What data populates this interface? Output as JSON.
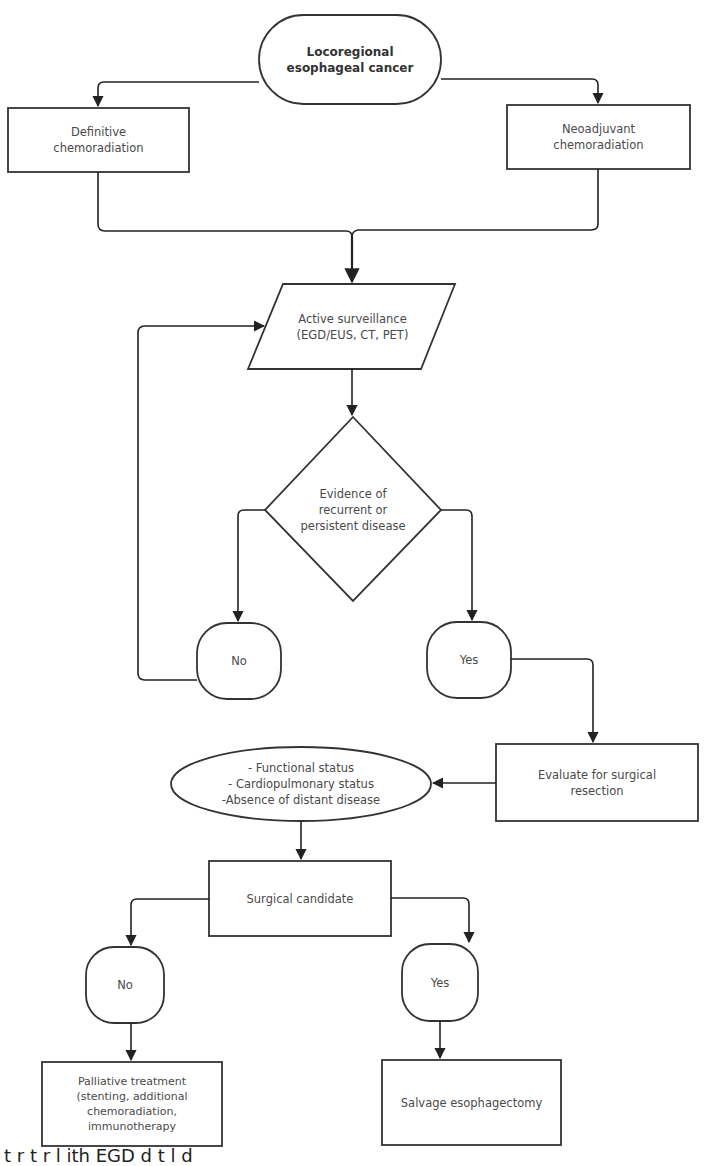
{
  "diagram": {
    "type": "flowchart",
    "stroke_color": "#333333",
    "text_color": "#4a4a4a",
    "nodes": {
      "start": {
        "label": "Locoregional\nesophageal cancer",
        "shape": "oval"
      },
      "definitive": {
        "label": "Definitive\nchemoradiation",
        "shape": "rectangle"
      },
      "neoadjuvant": {
        "label": "Neoadjuvant\nchemoradiation",
        "shape": "rectangle"
      },
      "surveillance": {
        "label": "Active surveillance\n(EGD/EUS, CT, PET)",
        "shape": "parallelogram"
      },
      "evidence": {
        "label": "Evidence of\nrecurrent or\npersistent disease",
        "shape": "diamond"
      },
      "no1": {
        "label": "No",
        "shape": "rounded"
      },
      "yes1": {
        "label": "Yes",
        "shape": "rounded"
      },
      "evaluate": {
        "label": "Evaluate for surgical\nresection",
        "shape": "rectangle"
      },
      "criteria": {
        "label": "- Functional status\n- Cardiopulmonary status\n-Absence of distant disease",
        "shape": "ellipse"
      },
      "candidate": {
        "label": "Surgical candidate",
        "shape": "rectangle"
      },
      "no2": {
        "label": "No",
        "shape": "rounded"
      },
      "yes2": {
        "label": "Yes",
        "shape": "rounded"
      },
      "palliative": {
        "label": "Palliative treatment\n(stenting, additional\nchemoradiation,\nimmunotherapy",
        "shape": "rectangle"
      },
      "salvage": {
        "label": "Salvage esophagectomy",
        "shape": "rectangle"
      }
    },
    "edges": [
      {
        "from": "start",
        "to": "definitive"
      },
      {
        "from": "start",
        "to": "neoadjuvant"
      },
      {
        "from": "definitive",
        "to": "surveillance"
      },
      {
        "from": "neoadjuvant",
        "to": "surveillance"
      },
      {
        "from": "surveillance",
        "to": "evidence"
      },
      {
        "from": "evidence",
        "to": "no1"
      },
      {
        "from": "evidence",
        "to": "yes1"
      },
      {
        "from": "no1",
        "to": "surveillance"
      },
      {
        "from": "yes1",
        "to": "evaluate"
      },
      {
        "from": "evaluate",
        "to": "criteria"
      },
      {
        "from": "criteria",
        "to": "candidate"
      },
      {
        "from": "candidate",
        "to": "no2"
      },
      {
        "from": "candidate",
        "to": "yes2"
      },
      {
        "from": "no2",
        "to": "palliative"
      },
      {
        "from": "yes2",
        "to": "salvage"
      }
    ]
  },
  "caption_fragment": "t       r    t        r       l  ith    EGD        d          t      l  d      "
}
